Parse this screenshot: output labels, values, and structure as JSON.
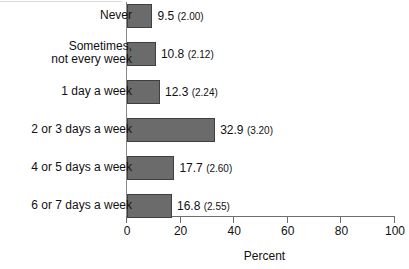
{
  "chart_data": {
    "type": "bar",
    "orientation": "horizontal",
    "title": "",
    "xlabel": "Percent",
    "ylabel": "",
    "xlim": [
      0,
      100
    ],
    "xticks": [
      0,
      20,
      40,
      60,
      80,
      100
    ],
    "xtick_labels": [
      "0",
      "20",
      "40",
      "60",
      "80",
      "100"
    ],
    "grid": false,
    "legend": null,
    "categories": [
      "Never",
      "Sometimes,\nnot every week",
      "1 day a week",
      "2 or 3 days a week",
      "4 or 5 days a week",
      "6 or 7 days a week"
    ],
    "values": [
      9.5,
      10.8,
      12.3,
      32.9,
      17.7,
      16.8
    ],
    "standard_errors": [
      2.0,
      2.12,
      2.24,
      3.2,
      2.6,
      2.55
    ],
    "data_labels": [
      "9.5 (2.00)",
      "10.8 (2.12)",
      "12.3 (2.24)",
      "32.9 (3.20)",
      "17.7 (2.60)",
      "16.8 (2.55)"
    ],
    "value_text": [
      "9.5",
      "10.8",
      "12.3",
      "32.9",
      "17.7",
      "16.8"
    ],
    "se_text": [
      "(2.00)",
      "(2.12)",
      "(2.24)",
      "(3.20)",
      "(2.60)",
      "(2.55)"
    ],
    "bar_color": "#6b6b6b",
    "bar_edge_color": "#3f3f3f",
    "axis_color": "#6e6e6e"
  }
}
